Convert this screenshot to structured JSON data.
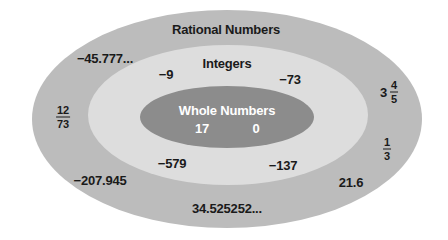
{
  "diagram": {
    "type": "nested-sets",
    "colors": {
      "background": "#ffffff",
      "rational": "#bcbcbc",
      "integers": "#dddddd",
      "whole": "#8c8c8c",
      "text": "#1a1a1a",
      "whole_text": "#ffffff"
    },
    "sets": {
      "rational": {
        "title": "Rational Numbers",
        "members": {
          "n1": "−45.777...",
          "n2": "−207.945",
          "n3": "34.525252...",
          "n4": "21.6",
          "frac_12_73": {
            "num": "12",
            "den": "73"
          },
          "frac_1_3": {
            "num": "1",
            "den": "3"
          },
          "mixed_3_4_5": {
            "whole": "3",
            "num": "4",
            "den": "5"
          }
        }
      },
      "integers": {
        "title": "Integers",
        "members": {
          "m1": "−9",
          "m2": "−73",
          "m3": "−579",
          "m4": "−137"
        }
      },
      "whole": {
        "title": "Whole Numbers",
        "members": {
          "w1": "17",
          "w2": "0"
        }
      }
    }
  }
}
